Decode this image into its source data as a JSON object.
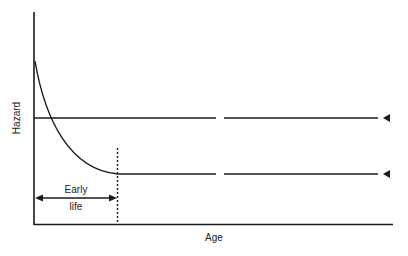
{
  "diagram": {
    "type": "hazard-curve",
    "y_axis_label": "Hazard",
    "x_axis_label": "Age",
    "annotation": {
      "line1": "Early",
      "line2": "life"
    },
    "curves": [
      {
        "name": "constant-hazard",
        "description": "Constant hazard level, line with break, arrow marker on right"
      },
      {
        "name": "decreasing-hazard",
        "description": "Hazard decreasing during early life then constant, line with break, arrow marker on right"
      }
    ],
    "colors": {
      "line": "#1a1a1a",
      "text": "#222222",
      "background": "#ffffff"
    }
  }
}
